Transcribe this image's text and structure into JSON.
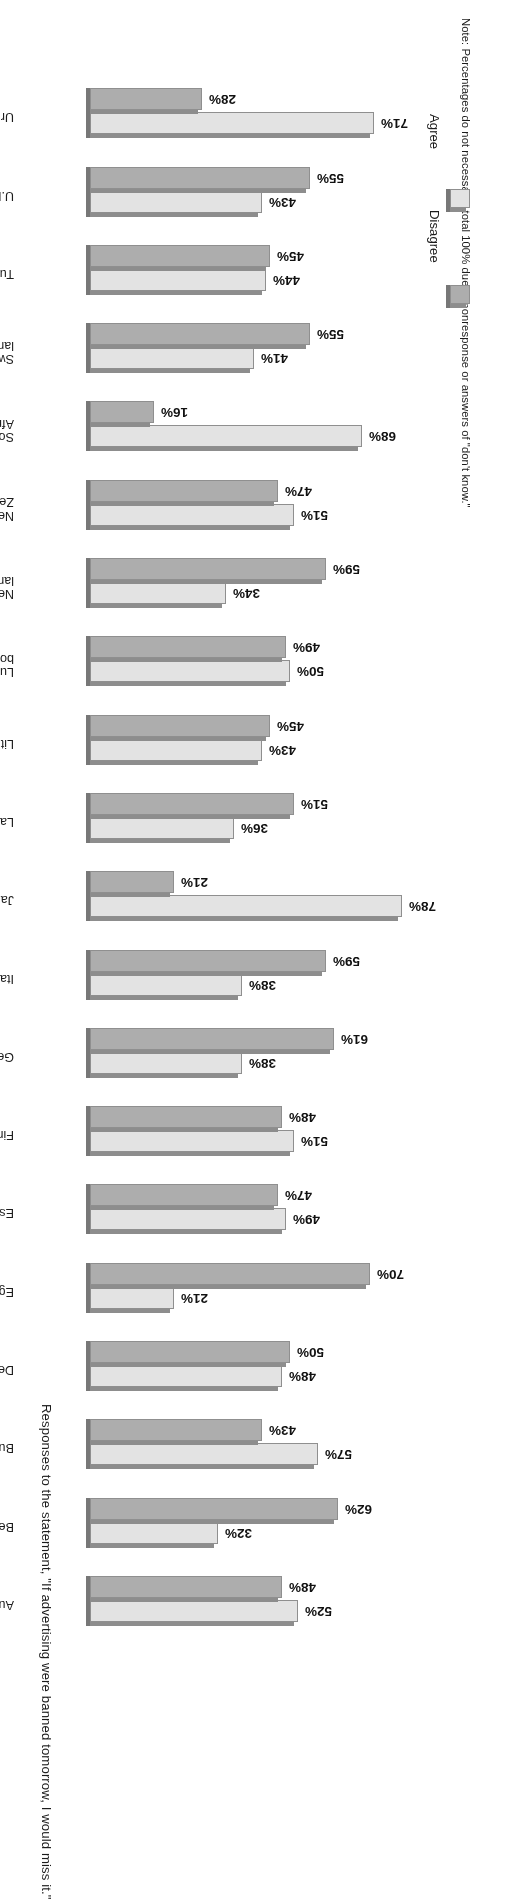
{
  "chart_data": {
    "type": "bar",
    "orientation": "horizontal",
    "title": "Responses to the statement, \"If advertising were banned tomorrow, I would miss it.\"",
    "note": "Note: Percentages do not necessarily total 100% due to nonresponse or answers of \"don't know.\"",
    "xlabel": "",
    "ylabel": "",
    "xlim": [
      0,
      80
    ],
    "grid": false,
    "legend_position": "bottom-left",
    "value_suffix": "%",
    "legend": [
      {
        "name": "Disagree",
        "color": "#adadad"
      },
      {
        "name": "Agree",
        "color": "#e3e3e3"
      }
    ],
    "categories": [
      "Australia",
      "Belgium",
      "Bulgaria",
      "Denmark",
      "Egypt",
      "Estonia",
      "Finland",
      "Germany",
      "Italy",
      "Japan",
      "Latvia",
      "Lithuania",
      "Luxem-\nbourg",
      "Nether-\nlands",
      "New\nZealand",
      "South\nAfrica",
      "Switzer-\nland",
      "Turkey",
      "U.K.",
      "Uruguay"
    ],
    "series": [
      {
        "name": "Agree",
        "color": "#e3e3e3",
        "values": [
          52,
          32,
          57,
          48,
          21,
          49,
          51,
          38,
          38,
          78,
          36,
          43,
          50,
          34,
          51,
          68,
          41,
          44,
          43,
          71
        ]
      },
      {
        "name": "Disagree",
        "color": "#adadad",
        "values": [
          48,
          62,
          43,
          50,
          70,
          47,
          48,
          61,
          59,
          21,
          51,
          45,
          49,
          59,
          47,
          16,
          55,
          45,
          55,
          28
        ]
      }
    ],
    "rows": [
      {
        "category": "Australia",
        "agree": 52,
        "disagree": 48,
        "agree_label": "52%",
        "disagree_label": "48%"
      },
      {
        "category": "Belgium",
        "agree": 32,
        "disagree": 62,
        "agree_label": "32%",
        "disagree_label": "62%"
      },
      {
        "category": "Bulgaria",
        "agree": 57,
        "disagree": 43,
        "agree_label": "57%",
        "disagree_label": "43%"
      },
      {
        "category": "Denmark",
        "agree": 48,
        "disagree": 50,
        "agree_label": "48%",
        "disagree_label": "50%"
      },
      {
        "category": "Egypt",
        "agree": 21,
        "disagree": 70,
        "agree_label": "21%",
        "disagree_label": "70%"
      },
      {
        "category": "Estonia",
        "agree": 49,
        "disagree": 47,
        "agree_label": "49%",
        "disagree_label": "47%"
      },
      {
        "category": "Finland",
        "agree": 51,
        "disagree": 48,
        "agree_label": "51%",
        "disagree_label": "48%"
      },
      {
        "category": "Germany",
        "agree": 38,
        "disagree": 61,
        "agree_label": "38%",
        "disagree_label": "61%"
      },
      {
        "category": "Italy",
        "agree": 38,
        "disagree": 59,
        "agree_label": "38%",
        "disagree_label": "59%"
      },
      {
        "category": "Japan",
        "agree": 78,
        "disagree": 21,
        "agree_label": "78%",
        "disagree_label": "21%"
      },
      {
        "category": "Latvia",
        "agree": 36,
        "disagree": 51,
        "agree_label": "36%",
        "disagree_label": "51%"
      },
      {
        "category": "Lithuania",
        "agree": 43,
        "disagree": 45,
        "agree_label": "43%",
        "disagree_label": "45%"
      },
      {
        "category": "Luxem-\nbourg",
        "agree": 50,
        "disagree": 49,
        "agree_label": "50%",
        "disagree_label": "49%"
      },
      {
        "category": "Nether-\nlands",
        "agree": 34,
        "disagree": 59,
        "agree_label": "34%",
        "disagree_label": "59%"
      },
      {
        "category": "New\nZealand",
        "agree": 51,
        "disagree": 47,
        "agree_label": "51%",
        "disagree_label": "47%"
      },
      {
        "category": "South\nAfrica",
        "agree": 68,
        "disagree": 16,
        "agree_label": "68%",
        "disagree_label": "16%"
      },
      {
        "category": "Switzer-\nland",
        "agree": 41,
        "disagree": 55,
        "agree_label": "41%",
        "disagree_label": "55%"
      },
      {
        "category": "Turkey",
        "agree": 44,
        "disagree": 45,
        "agree_label": "44%",
        "disagree_label": "45%"
      },
      {
        "category": "U.K.",
        "agree": 43,
        "disagree": 55,
        "agree_label": "43%",
        "disagree_label": "55%"
      },
      {
        "category": "Uruguay",
        "agree": 71,
        "disagree": 28,
        "agree_label": "71%",
        "disagree_label": "28%"
      }
    ]
  }
}
